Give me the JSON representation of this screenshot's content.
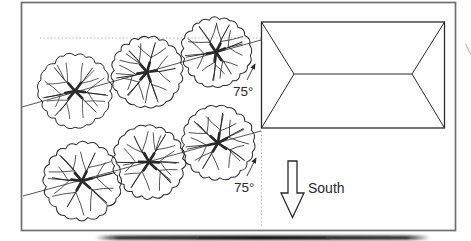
{
  "diagram": {
    "labels": {
      "angle_row_top": "75°",
      "angle_row_bottom": "75°",
      "direction_south": "South"
    },
    "colors": {
      "ink": "#2a2a2a",
      "frame": "#6e6e6e",
      "guide": "#a8a8a8",
      "paper": "#ffffff"
    },
    "counts": {
      "trees": 6,
      "rows": 2,
      "trees_per_row": 3
    }
  }
}
